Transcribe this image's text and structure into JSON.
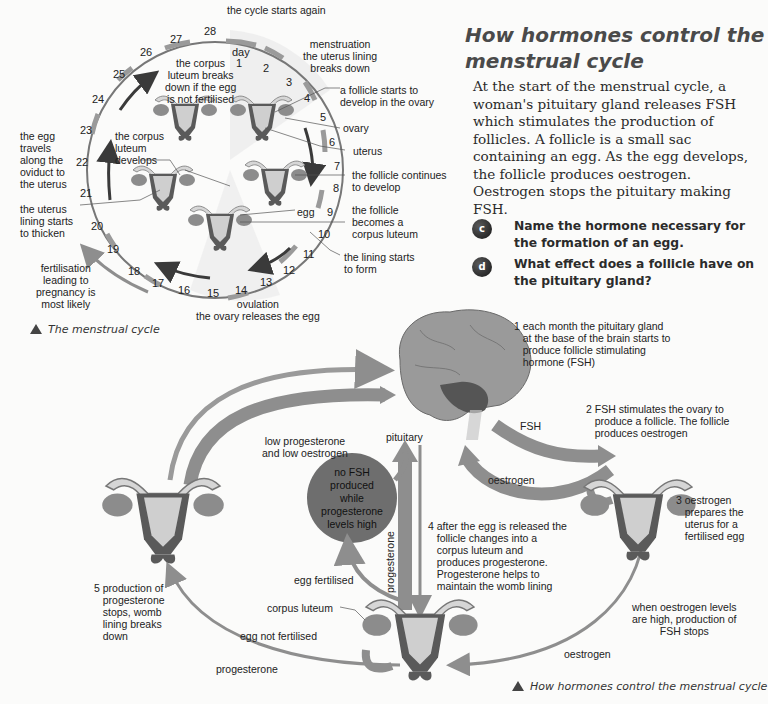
{
  "article": {
    "title": "How hormones control the menstrual cycle",
    "paragraph": "At the start of the menstrual cycle, a woman's pituitary gland releases FSH which stimulates the production of follicles. A follicle is a small sac containing an egg. As the egg develops, the follicle produces oestrogen. Oestrogen stops the pituitary making FSH.",
    "questions": [
      {
        "badge": "c",
        "text": "Name the hormone necessary for the formation of an egg."
      },
      {
        "badge": "d",
        "text": "What effect does a follicle have on the pituitary gland?"
      }
    ]
  },
  "cycle_diagram": {
    "caption": "The menstrual cycle",
    "day_label": "day",
    "days": [
      "1",
      "2",
      "3",
      "4",
      "5",
      "6",
      "7",
      "8",
      "9",
      "10",
      "11",
      "12",
      "13",
      "14",
      "15",
      "16",
      "17",
      "18",
      "19",
      "20",
      "21",
      "22",
      "23",
      "24",
      "25",
      "26",
      "27",
      "28"
    ],
    "labels": {
      "cycle_starts_again": "the cycle starts again",
      "menstruation": "menstruation\nthe uterus lining\nbreaks down",
      "follicle_starts": "a follicle starts to\ndevelop in the ovary",
      "ovary": "ovary",
      "uterus": "uterus",
      "follicle_continues": "the follicle continues\nto develop",
      "egg": "egg",
      "follicle_becomes": "the follicle\nbecomes a\ncorpus luteum",
      "lining_starts": "the lining starts\nto form",
      "ovulation": "ovulation\nthe ovary releases the egg",
      "fertilisation": "fertilisation\nleading to\npregnancy is\nmost likely",
      "lining_thicken": "the uterus\nlining starts\nto thicken",
      "egg_travels": "the egg\ntravels\nalong the\noviduct to\nthe uterus",
      "corpus_develops": "the corpus\nluteum\ndevelops",
      "corpus_breaks": "the corpus\nluteum breaks\ndown if the egg\nis not fertilised"
    }
  },
  "hormone_diagram": {
    "caption": "How hormones control the menstrual cycle",
    "labels": {
      "step1": "1 each month the pituitary gland\n   at the base of the brain starts to\n   produce follicle stimulating\n   hormone (FSH)",
      "step2": "2 FSH stimulates the ovary to\n   produce a follicle. The follicle\n   produces oestrogen",
      "step3": "3 oestrogen\n   prepares the\n   uterus for a\n   fertilised egg",
      "step4": "4 after the egg is released the\n   follicle changes into a\n   corpus luteum and\n   produces progesterone.\n   Progesterone helps to\n   maintain the womb lining",
      "step5": "5 production of\n   progesterone\n   stops, womb\n   lining breaks\n   down",
      "pituitary": "pituitary",
      "fsh": "FSH",
      "oestrogen_upper": "oestrogen",
      "oestrogen_lower": "oestrogen",
      "low_levels": "low progesterone\nand low oestrogen",
      "no_fsh": "no FSH\nproduced\nwhile\nprogesterone\nlevels high",
      "progesterone_vertical": "progesterone",
      "progesterone_bottom": "progesterone",
      "egg_fertilised": "egg fertilised",
      "egg_not_fertilised": "egg not fertilised",
      "corpus_luteum": "corpus luteum",
      "oestrogen_high": "when oestrogen levels\nare high, production of\nFSH stops"
    }
  },
  "colors": {
    "arrow_gray": "#8e8e8e",
    "dark_arrow": "#3a3a3a",
    "uterus_dark": "#5a5a5a",
    "uterus_light": "#cfcfcf",
    "ovary": "#8c8c8c",
    "brain": "#9a9a9a"
  }
}
